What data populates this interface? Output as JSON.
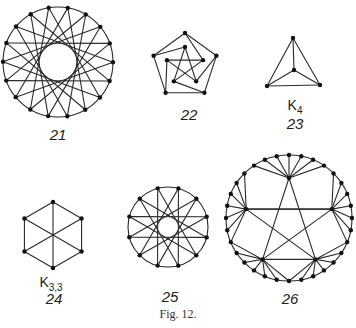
{
  "figure": {
    "caption": "Fig. 12.",
    "graphs": [
      {
        "id": "21",
        "label": "21",
        "name": "",
        "cx": 58,
        "cy": 62,
        "r": 55,
        "n": 18
      },
      {
        "id": "22",
        "label": "22",
        "name": "",
        "type": "petersen-like pentagon"
      },
      {
        "id": "23",
        "label": "23",
        "name": "K",
        "name_sub": "4",
        "type": "complete graph K4"
      },
      {
        "id": "24",
        "label": "24",
        "name": "K",
        "name_sub": "3,3",
        "type": "complete bipartite K3,3"
      },
      {
        "id": "25",
        "label": "25",
        "name": "",
        "cx": 168,
        "cy": 227,
        "r": 40,
        "n": 12
      },
      {
        "id": "26",
        "label": "26",
        "name": "",
        "cx": 289,
        "cy": 218,
        "r": 63,
        "n": 32
      }
    ],
    "colors": {
      "line": "#2a2a2a",
      "vertex": "#111111",
      "background": "#ffffff"
    }
  }
}
